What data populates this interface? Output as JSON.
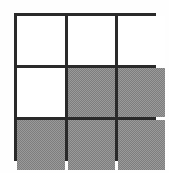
{
  "figure": {
    "canvas_width": 169,
    "canvas_height": 173,
    "background_color": "#fefefe",
    "line_color": "#2a2a2a",
    "line_width": 3,
    "white_fill": "#ffffff",
    "gray_fill": "#9a9a9a"
  },
  "chart_data": {
    "type": "heatmap",
    "title": "",
    "xlabel": "",
    "ylabel": "",
    "rows": 3,
    "columns": 3,
    "categories": [
      "col-1",
      "col-2",
      "col-3"
    ],
    "row_labels": [
      "row-1",
      "row-2",
      "row-3"
    ],
    "legend": [
      {
        "label": "unshaded",
        "value": 0,
        "color": "#ffffff"
      },
      {
        "label": "shaded",
        "value": 1,
        "color": "#9a9a9a"
      }
    ],
    "values": [
      [
        0,
        0,
        0
      ],
      [
        0,
        1,
        1
      ],
      [
        1,
        1,
        1
      ]
    ],
    "shaded_count": 5,
    "unshaded_count": 4,
    "shaded_fraction": "5/9",
    "grid": true
  },
  "cells": [
    {
      "id": "cell-r1c1",
      "row": 1,
      "column": 1,
      "state": "unshaded",
      "fill": "#ffffff"
    },
    {
      "id": "cell-r1c2",
      "row": 1,
      "column": 2,
      "state": "unshaded",
      "fill": "#ffffff"
    },
    {
      "id": "cell-r1c3",
      "row": 1,
      "column": 3,
      "state": "unshaded",
      "fill": "#ffffff"
    },
    {
      "id": "cell-r2c1",
      "row": 2,
      "column": 1,
      "state": "unshaded",
      "fill": "#ffffff"
    },
    {
      "id": "cell-r2c2",
      "row": 2,
      "column": 2,
      "state": "shaded",
      "fill": "#9a9a9a"
    },
    {
      "id": "cell-r2c3",
      "row": 2,
      "column": 3,
      "state": "shaded",
      "fill": "#9a9a9a"
    },
    {
      "id": "cell-r3c1",
      "row": 3,
      "column": 1,
      "state": "shaded",
      "fill": "#9a9a9a"
    },
    {
      "id": "cell-r3c2",
      "row": 3,
      "column": 2,
      "state": "shaded",
      "fill": "#9a9a9a"
    },
    {
      "id": "cell-r3c3",
      "row": 3,
      "column": 3,
      "state": "shaded",
      "fill": "#9a9a9a"
    }
  ]
}
